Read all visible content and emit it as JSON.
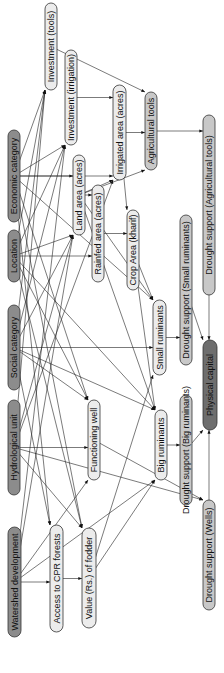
{
  "diagram": {
    "type": "directed-graph",
    "colors": {
      "root_fill": "#8c8c8c",
      "intermediate_fill": "#ececec",
      "outcome_fill": "#c8c8c8",
      "target_fill": "#6e6e6e",
      "edge": "#222222"
    },
    "nodes": [
      {
        "id": "economic",
        "label": "Economic category",
        "kind": "root"
      },
      {
        "id": "location",
        "label": "Location",
        "kind": "root"
      },
      {
        "id": "social",
        "label": "Social category",
        "kind": "root"
      },
      {
        "id": "hydro",
        "label": "Hydrological unit",
        "kind": "root"
      },
      {
        "id": "watershed",
        "label": "Watershed development",
        "kind": "root"
      },
      {
        "id": "inv_tools",
        "label": "Investment (tools)",
        "kind": "intermediate"
      },
      {
        "id": "inv_irr",
        "label": "Investment (irrigation)",
        "kind": "intermediate"
      },
      {
        "id": "land",
        "label": "Land area (acres)",
        "kind": "intermediate"
      },
      {
        "id": "rainfed",
        "label": "Rainfed area (acres)",
        "kind": "intermediate"
      },
      {
        "id": "irrigated",
        "label": "Irrigated area (acres)",
        "kind": "intermediate"
      },
      {
        "id": "agtools",
        "label": "Agricultural tools",
        "kind": "outcome"
      },
      {
        "id": "crop",
        "label": "Crop Area (kharif)",
        "kind": "intermediate"
      },
      {
        "id": "small",
        "label": "Small ruminants",
        "kind": "intermediate"
      },
      {
        "id": "well",
        "label": "Functioning well",
        "kind": "intermediate"
      },
      {
        "id": "big",
        "label": "Big ruminants",
        "kind": "intermediate"
      },
      {
        "id": "cpr",
        "label": "Access to CPR forests",
        "kind": "intermediate"
      },
      {
        "id": "fodder",
        "label": "Value (Rs.) of fodder",
        "kind": "intermediate"
      },
      {
        "id": "ds_small",
        "label": "Drought support (Small ruminants)",
        "kind": "outcome"
      },
      {
        "id": "ds_tools",
        "label": "Drought support (Agricultural tools)",
        "kind": "outcome"
      },
      {
        "id": "physical",
        "label": "Physical capital",
        "kind": "target"
      },
      {
        "id": "ds_big",
        "label": "Drought support (Big ruminants)",
        "kind": "outcome"
      },
      {
        "id": "ds_wells",
        "label": "Drought support (Wells)",
        "kind": "outcome"
      }
    ],
    "edges": [
      [
        "economic",
        "inv_tools"
      ],
      [
        "economic",
        "inv_irr"
      ],
      [
        "economic",
        "land"
      ],
      [
        "economic",
        "irrigated"
      ],
      [
        "economic",
        "well"
      ],
      [
        "economic",
        "small"
      ],
      [
        "economic",
        "fodder"
      ],
      [
        "economic",
        "cpr"
      ],
      [
        "location",
        "inv_tools"
      ],
      [
        "location",
        "inv_irr"
      ],
      [
        "location",
        "land"
      ],
      [
        "location",
        "rainfed"
      ],
      [
        "location",
        "well"
      ],
      [
        "location",
        "big"
      ],
      [
        "location",
        "fodder"
      ],
      [
        "social",
        "inv_tools"
      ],
      [
        "social",
        "inv_irr"
      ],
      [
        "social",
        "land"
      ],
      [
        "social",
        "well"
      ],
      [
        "social",
        "small"
      ],
      [
        "social",
        "big"
      ],
      [
        "social",
        "cpr"
      ],
      [
        "hydro",
        "inv_tools"
      ],
      [
        "hydro",
        "land"
      ],
      [
        "hydro",
        "well"
      ],
      [
        "hydro",
        "irrigated"
      ],
      [
        "hydro",
        "fodder"
      ],
      [
        "hydro",
        "ds_wells"
      ],
      [
        "watershed",
        "inv_irr"
      ],
      [
        "watershed",
        "land"
      ],
      [
        "watershed",
        "well"
      ],
      [
        "watershed",
        "cpr"
      ],
      [
        "watershed",
        "big"
      ],
      [
        "inv_tools",
        "agtools"
      ],
      [
        "inv_irr",
        "irrigated"
      ],
      [
        "land",
        "rainfed"
      ],
      [
        "land",
        "irrigated"
      ],
      [
        "land",
        "small"
      ],
      [
        "land",
        "big"
      ],
      [
        "land",
        "agtools"
      ],
      [
        "rainfed",
        "crop"
      ],
      [
        "irrigated",
        "agtools"
      ],
      [
        "irrigated",
        "crop"
      ],
      [
        "agtools",
        "ds_tools"
      ],
      [
        "crop",
        "small"
      ],
      [
        "crop",
        "big"
      ],
      [
        "small",
        "ds_small"
      ],
      [
        "big",
        "ds_big"
      ],
      [
        "well",
        "ds_wells"
      ],
      [
        "cpr",
        "fodder"
      ],
      [
        "fodder",
        "big"
      ],
      [
        "fodder",
        "small"
      ],
      [
        "ds_small",
        "physical"
      ],
      [
        "ds_tools",
        "physical"
      ],
      [
        "ds_big",
        "physical"
      ],
      [
        "ds_wells",
        "physical"
      ]
    ]
  }
}
